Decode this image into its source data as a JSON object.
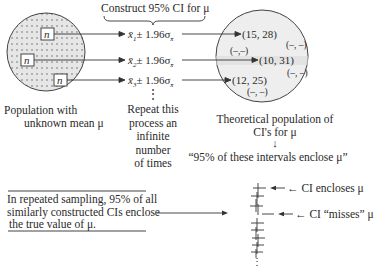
{
  "header": {
    "construct_label": "Construct 95% CI for μ"
  },
  "population": {
    "sample_box_label": "n",
    "caption_line1": "Population with",
    "caption_line2": "unknown mean μ"
  },
  "formulas": [
    {
      "xbar": "x̄",
      "sub": "1",
      "rest": "± 1.96σ",
      "sigma_sub": "x̄"
    },
    {
      "xbar": "x̄",
      "sub": "2",
      "rest": "± 1.96σ",
      "sigma_sub": "x̄"
    },
    {
      "xbar": "x̄",
      "sub": "3",
      "rest": "± 1.96σ",
      "sigma_sub": "x̄"
    }
  ],
  "repeat": {
    "ellipsis": "⋮",
    "lines": [
      "Repeat this",
      "process an",
      "infinite",
      "number",
      "of times"
    ]
  },
  "theoretical": {
    "intervals": [
      "(15, 28)",
      "(10, 31)",
      "(12, 25)"
    ],
    "placeholders": [
      "(–, –)",
      "(–,–)",
      "(–, –)",
      "(–, –)"
    ],
    "caption_line1": "Theoretical population of",
    "caption_line2": "CI's for μ",
    "arrow": "↓",
    "quote": "“95% of these intervals enclose μ”"
  },
  "summary": {
    "lines": [
      "In repeated sampling, 95% of all",
      "similarly constructed CIs enclose",
      "the true value of μ."
    ]
  },
  "ci_stack": {
    "encloses_label": "← CI encloses μ",
    "misses_label": "← CI “misses” μ",
    "ellipsis": "⋮"
  },
  "colors": {
    "ink": "#2a2a2a",
    "population_fill": "#e6e6e6",
    "theoretical_fill": "#eeeeee",
    "dot": "#555555"
  }
}
